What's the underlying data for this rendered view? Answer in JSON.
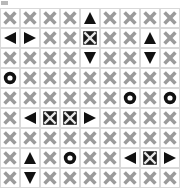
{
  "board": {
    "title": "Grid Puzzle Board",
    "columns": 9,
    "rows": 9,
    "cell_size_px": 20,
    "colors": {
      "background": "#ffffff",
      "cell_border": "#d9d9d9",
      "x_mark": "#9b9b9b",
      "dark_mark": "#111111",
      "boxed_fill": "#1a1a1a",
      "boxed_cut": "#e8e8e8",
      "corner_mark": "#b8b8b8"
    },
    "symbol_legend": {
      "x": "x-mark-icon",
      "boxed-x": "boxed-x-icon",
      "up": "triangle-up-icon",
      "down": "triangle-down-icon",
      "left": "triangle-left-icon",
      "right": "triangle-right-icon",
      "circle": "ring-circle-icon"
    },
    "cells": [
      [
        "x",
        "x",
        "x",
        "x",
        "up",
        "x",
        "x",
        "x",
        "x"
      ],
      [
        "left",
        "right",
        "x",
        "x",
        "boxed-x",
        "x",
        "x",
        "up",
        "x"
      ],
      [
        "x",
        "x",
        "x",
        "x",
        "down",
        "x",
        "x",
        "down",
        "x"
      ],
      [
        "circle",
        "x",
        "x",
        "x",
        "x",
        "x",
        "x",
        "x",
        "x"
      ],
      [
        "x",
        "x",
        "x",
        "x",
        "x",
        "x",
        "circle",
        "x",
        "circle"
      ],
      [
        "x",
        "left",
        "boxed-x",
        "boxed-x",
        "right",
        "x",
        "x",
        "x",
        "x"
      ],
      [
        "x",
        "x",
        "x",
        "x",
        "x",
        "x",
        "x",
        "x",
        "x"
      ],
      [
        "x",
        "up",
        "x",
        "circle",
        "x",
        "x",
        "left",
        "boxed-x",
        "right"
      ],
      [
        "x",
        "down",
        "x",
        "x",
        "x",
        "x",
        "x",
        "x",
        "x"
      ]
    ]
  }
}
